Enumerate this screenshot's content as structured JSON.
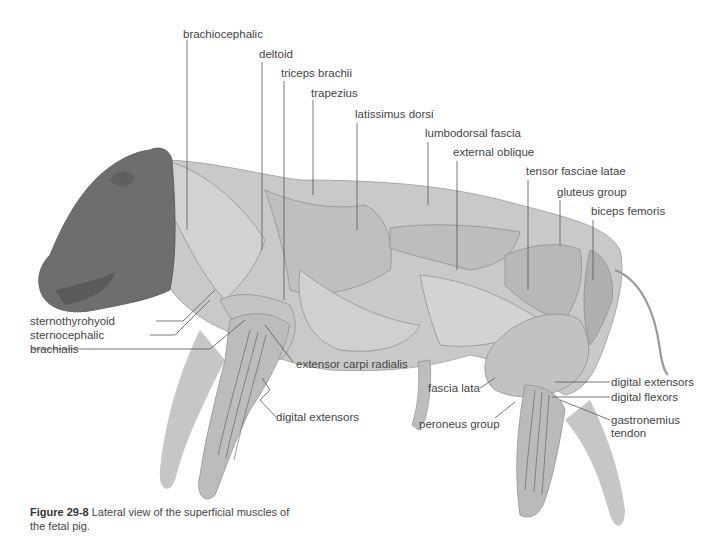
{
  "figure": {
    "caption_number": "Figure 29-8",
    "caption_text": "Lateral view of the superficial muscles of the fetal pig.",
    "colors": {
      "head": "#6b6b6b",
      "body": "#c8c8c8",
      "limbs": "#bdbdbd",
      "lines": "#555555",
      "background": "#ffffff"
    }
  },
  "labels": {
    "brachiocephalic": "brachiocephalic",
    "deltoid": "deltoid",
    "triceps_brachii": "triceps brachii",
    "trapezius": "trapezius",
    "latissimus_dorsi": "latissimus dorsi",
    "lumbodorsal_fascia": "lumbodorsal fascia",
    "external_oblique": "external oblique",
    "tensor_fasciae_latae": "tensor fasciae latae",
    "gluteus_group": "gluteus group",
    "biceps_femoris": "biceps femoris",
    "sternothyrohyoid": "sternothyrohyoid",
    "sternocephalic": "sternocephalic",
    "brachialis": "brachialis",
    "extensor_carpi_radialis": "extensor carpi radialis",
    "digital_extensors_fore": "digital extensors",
    "fascia_lata": "fascia lata",
    "peroneus_group": "peroneus group",
    "digital_extensors_hind": "digital extensors",
    "digital_flexors": "digital flexors",
    "gastronemius_line1": "gastronemius",
    "gastronemius_line2": "tendon"
  }
}
